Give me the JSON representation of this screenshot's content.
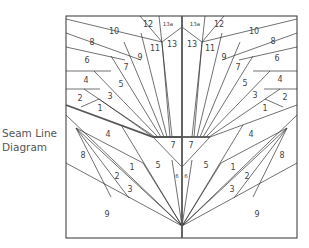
{
  "caption": {
    "line1": "Seam Line",
    "line2": "Diagram"
  },
  "colors": {
    "line": "#333333",
    "thick": "#555555",
    "label": "#444444",
    "background": "#ffffff"
  },
  "labels": {
    "top_left": {
      "n12": "12",
      "n13a": "13a",
      "n10": "10",
      "n11": "11",
      "n13": "13",
      "n8": "8",
      "n9": "9",
      "n6": "6",
      "n7": "7",
      "n4": "4",
      "n5": "5",
      "n2": "2",
      "n3": "3",
      "n1": "1"
    },
    "top_right": {
      "n12": "12",
      "n13a": "13a",
      "n10": "10",
      "n11": "11",
      "n13": "13",
      "n8": "8",
      "n9": "9",
      "n6": "6",
      "n7": "7",
      "n4": "4",
      "n5": "5",
      "n2": "2",
      "n3": "3",
      "n1": "1"
    },
    "bottom_left": {
      "n4": "4",
      "n8": "8",
      "n1": "1",
      "n5": "5",
      "n7": "7",
      "n2": "2",
      "n3": "3",
      "n6": "6",
      "n9": "9"
    },
    "bottom_right": {
      "n4": "4",
      "n8": "8",
      "n1": "1",
      "n5": "5",
      "n7": "7",
      "n2": "2",
      "n3": "3",
      "n6": "6",
      "n9": "9"
    }
  }
}
